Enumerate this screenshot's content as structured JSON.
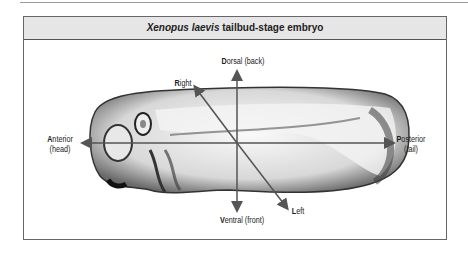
{
  "figure": {
    "title_italic": "Xenopus laevis",
    "title_rest": " tailbud-stage embryo",
    "labels": {
      "dorsal": {
        "initial": "D",
        "rest": "orsal (back)"
      },
      "ventral": {
        "initial": "V",
        "rest": "entral (front)"
      },
      "right": {
        "initial": "R",
        "rest": "ight"
      },
      "left": {
        "initial": "L",
        "rest": "eft"
      },
      "anterior": {
        "initial": "A",
        "rest": "nterior",
        "line2": "(head)"
      },
      "posterior": {
        "initial": "P",
        "rest": "osterior",
        "line2": "(tail)"
      }
    },
    "colors": {
      "header_bg": "#e6e6e6",
      "border": "#666666",
      "axis": "#555555"
    }
  }
}
